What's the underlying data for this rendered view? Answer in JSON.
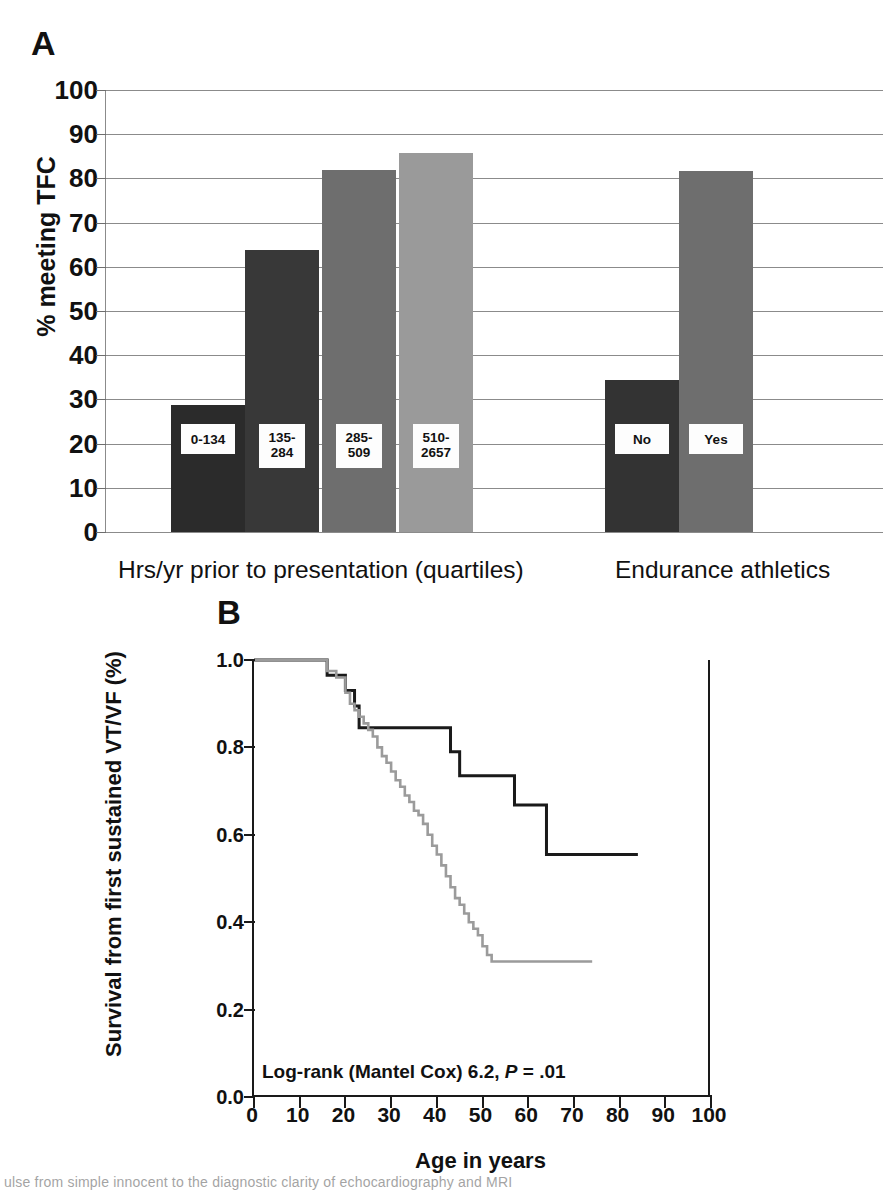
{
  "figure": {
    "panel_a_letter": "A",
    "panel_b_letter": "B"
  },
  "chart_data": [
    {
      "type": "bar",
      "panel": "A",
      "title": "",
      "xlabel": "",
      "ylabel": "% meeting TFC",
      "ylim": [
        0,
        100
      ],
      "ytick_labels": [
        "0",
        "10",
        "20",
        "30",
        "40",
        "50",
        "60",
        "70",
        "80",
        "90",
        "100"
      ],
      "yticks": [
        0,
        10,
        20,
        30,
        40,
        50,
        60,
        70,
        80,
        90,
        100
      ],
      "grid": true,
      "legend": "none",
      "groups": [
        {
          "group_label": "Hrs/yr prior to presentation (quartiles)",
          "categories": [
            "0-134",
            "135-284",
            "285-509",
            "510-2657"
          ],
          "values": [
            28.7,
            63.7,
            81.8,
            85.8
          ],
          "colors": [
            "#2b2b2b",
            "#383838",
            "#6e6e6e",
            "#9a9a9a"
          ]
        },
        {
          "group_label": "Endurance athletics",
          "categories": [
            "No",
            "Yes"
          ],
          "values": [
            34.4,
            81.6
          ],
          "colors": [
            "#333333",
            "#6e6e6e"
          ]
        }
      ]
    },
    {
      "type": "line",
      "panel": "B",
      "title": "",
      "xlabel": "Age in years",
      "ylabel": "Survival from first sustained VT/VF (%)",
      "xlim": [
        0,
        100
      ],
      "ylim": [
        0.0,
        1.0
      ],
      "xtick_labels": [
        "0",
        "10",
        "20",
        "30",
        "40",
        "50",
        "60",
        "70",
        "80",
        "90",
        "100"
      ],
      "xticks": [
        0,
        10,
        20,
        30,
        40,
        50,
        60,
        70,
        80,
        90,
        100
      ],
      "ytick_labels": [
        "0.0",
        "0.2",
        "0.4",
        "0.6",
        "0.8",
        "1.0"
      ],
      "yticks": [
        0.0,
        0.2,
        0.4,
        0.6,
        0.8,
        1.0
      ],
      "grid": false,
      "legend_position": "upper right",
      "annotation": "Log-rank (Mantel Cox) 6.2, P = .01",
      "annotation_prefix": "Log-rank (Mantel Cox) 6.2, ",
      "annotation_italic": "P",
      "annotation_suffix": " = .01",
      "series": [
        {
          "name": "Non-athlete",
          "color": "#1a1a1a",
          "step": "post",
          "x": [
            0,
            15,
            16,
            19,
            20,
            21,
            22,
            23,
            27,
            41,
            43,
            45,
            48,
            57,
            64,
            84
          ],
          "y": [
            1.0,
            1.0,
            0.965,
            0.965,
            0.93,
            0.93,
            0.895,
            0.845,
            0.845,
            0.845,
            0.79,
            0.735,
            0.735,
            0.668,
            0.555,
            0.555
          ]
        },
        {
          "name": "Athlete",
          "color": "#9b9b9b",
          "step": "post",
          "x": [
            0,
            14,
            16,
            18,
            20,
            21,
            22,
            23,
            24,
            25,
            26,
            27,
            28,
            29,
            30,
            31,
            32,
            33,
            34,
            35,
            36,
            37,
            38,
            39,
            40,
            41,
            42,
            43,
            44,
            45,
            46,
            47,
            48,
            49,
            50,
            51,
            52,
            74
          ],
          "y": [
            1.0,
            1.0,
            0.975,
            0.96,
            0.925,
            0.9,
            0.885,
            0.87,
            0.855,
            0.84,
            0.825,
            0.8,
            0.78,
            0.765,
            0.745,
            0.725,
            0.71,
            0.69,
            0.675,
            0.655,
            0.645,
            0.625,
            0.6,
            0.575,
            0.555,
            0.53,
            0.505,
            0.48,
            0.455,
            0.44,
            0.42,
            0.4,
            0.385,
            0.37,
            0.345,
            0.325,
            0.31,
            0.31
          ]
        }
      ]
    }
  ],
  "panel_a": {
    "y_axis_label": "% meeting TFC",
    "y_ticks": [
      "100",
      "90",
      "80",
      "70",
      "60",
      "50",
      "40",
      "30",
      "20",
      "10",
      "0"
    ],
    "bars": [
      {
        "label": "0-134",
        "value": 28.7,
        "color": "#2b2b2b"
      },
      {
        "label": "135-\n284",
        "value": 63.7,
        "color": "#383838"
      },
      {
        "label": "285-\n509",
        "value": 81.8,
        "color": "#6e6e6e"
      },
      {
        "label": "510-\n2657",
        "value": 85.8,
        "color": "#9a9a9a"
      },
      {
        "label": "No",
        "value": 34.4,
        "color": "#333333"
      },
      {
        "label": "Yes",
        "value": 81.6,
        "color": "#6e6e6e"
      }
    ],
    "x_categories": [
      "Hrs/yr prior to presentation (quartiles)",
      "Endurance athletics"
    ]
  },
  "panel_b": {
    "y_axis_label": "Survival from first sustained VT/VF (%)",
    "x_axis_label": "Age in years",
    "y_ticks": [
      "1.0",
      "0.8",
      "0.6",
      "0.4",
      "0.2",
      "0.0"
    ],
    "x_ticks": [
      "0",
      "10",
      "20",
      "30",
      "40",
      "50",
      "60",
      "70",
      "80",
      "90",
      "100"
    ],
    "legend": [
      {
        "label": "Non-athlete",
        "color": "#1a1a1a"
      },
      {
        "label": "Athlete",
        "color": "#9b9b9b"
      }
    ],
    "annotation_prefix": "Log-rank (Mantel Cox) 6.2, ",
    "annotation_italic": "P",
    "annotation_suffix": " = .01"
  },
  "scan_artifact": {
    "text": "ulse from simple innocent to the diagnostic clarity of echocardiography and MRI"
  }
}
